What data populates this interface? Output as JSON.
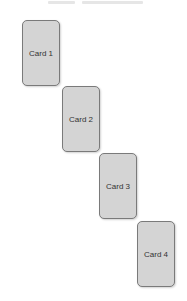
{
  "header": {
    "clipped_text_segments": [
      {
        "left": 48,
        "width": 27
      },
      {
        "left": 82,
        "width": 61
      }
    ]
  },
  "cards": [
    {
      "label": "Card 1",
      "left": 22,
      "top": 20
    },
    {
      "label": "Card 2",
      "left": 62,
      "top": 86
    },
    {
      "label": "Card 3",
      "left": 99,
      "top": 153
    },
    {
      "label": "Card 4",
      "left": 137,
      "top": 221
    }
  ],
  "colors": {
    "card_fill": "#d4d4d4",
    "card_border": "#7a7a7a",
    "label_text": "#333333"
  }
}
